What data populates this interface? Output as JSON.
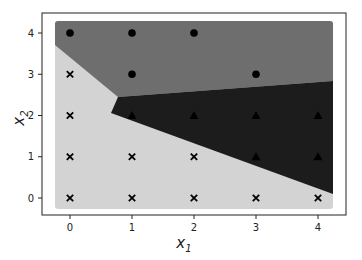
{
  "chart_data": {
    "type": "scatter",
    "title": "",
    "xlabel": "x",
    "xlabel_sub": "1",
    "ylabel": "x",
    "ylabel_sub": "2",
    "xlim": [
      -0.45,
      4.45
    ],
    "ylim": [
      -0.42,
      4.48
    ],
    "xticks": [
      0,
      1,
      2,
      3,
      4
    ],
    "yticks": [
      0,
      1,
      2,
      3,
      4
    ],
    "xtick_labels": [
      "0",
      "1",
      "2",
      "3",
      "4"
    ],
    "ytick_labels": [
      "0",
      "1",
      "2",
      "3",
      "4"
    ],
    "grid": false,
    "legend": null,
    "decision_regions": [
      {
        "class": 0,
        "color": "#6e6e6e",
        "label": "region-class-0"
      },
      {
        "class": 1,
        "color": "#1c1c1c",
        "label": "region-class-1"
      },
      {
        "class": 2,
        "color": "#d3d3d3",
        "label": "region-class-2"
      }
    ],
    "series": [
      {
        "name": "class 0",
        "marker": "circle",
        "color": "#000000",
        "points": [
          [
            0,
            4
          ],
          [
            1,
            4
          ],
          [
            2,
            4
          ],
          [
            1,
            3
          ],
          [
            3,
            3
          ]
        ]
      },
      {
        "name": "class 1",
        "marker": "triangle",
        "color": "#000000",
        "points": [
          [
            1,
            2
          ],
          [
            2,
            2
          ],
          [
            3,
            2
          ],
          [
            4,
            2
          ],
          [
            3,
            1
          ],
          [
            4,
            1
          ]
        ]
      },
      {
        "name": "class 2",
        "marker": "x",
        "color": "#000000",
        "points": [
          [
            0,
            3
          ],
          [
            0,
            2
          ],
          [
            0,
            1
          ],
          [
            1,
            1
          ],
          [
            2,
            1
          ],
          [
            0,
            0
          ],
          [
            1,
            0
          ],
          [
            2,
            0
          ],
          [
            3,
            0
          ],
          [
            4,
            0
          ]
        ]
      }
    ]
  }
}
